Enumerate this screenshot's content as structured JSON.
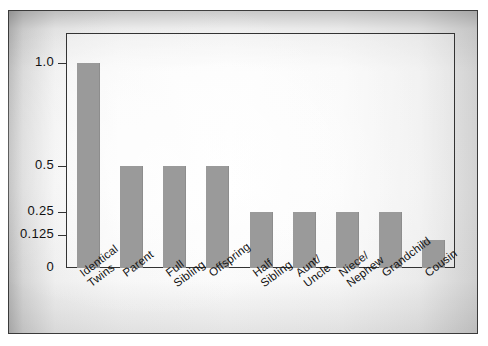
{
  "chart_data": {
    "type": "bar",
    "title": "",
    "subtitle": "",
    "xlabel": "",
    "ylabel": "",
    "grid": false,
    "legend": "none",
    "y_scale": "non-linear halving scale",
    "ylim": [
      0,
      1.0
    ],
    "y_ticks": [
      {
        "label": "1.0",
        "value": 1.0
      },
      {
        "label": "0.5",
        "value": 0.5
      },
      {
        "label": "0.25",
        "value": 0.25
      },
      {
        "label": "0.125",
        "value": 0.125
      },
      {
        "label": "0",
        "value": 0
      }
    ],
    "categories": [
      "Identical Twins",
      "Parent",
      "Full Sibling",
      "Offspring",
      "Half Sibling",
      "Aunt/ Uncle",
      "Niece/ Nephew",
      "Grandchild",
      "Cousin"
    ],
    "values": [
      1.0,
      0.5,
      0.5,
      0.5,
      0.25,
      0.25,
      0.25,
      0.25,
      0.125
    ],
    "bar_color": "#9a9a9a"
  },
  "axis": {
    "ticks": [
      {
        "label": "1.0"
      },
      {
        "label": "0.5"
      },
      {
        "label": "0.25"
      },
      {
        "label": "0.125"
      },
      {
        "label": "0"
      }
    ]
  },
  "x_labels": [
    {
      "line1": "Identical",
      "line2": "Twins"
    },
    {
      "line1": "Parent",
      "line2": ""
    },
    {
      "line1": "Full",
      "line2": "Sibling"
    },
    {
      "line1": "Offspring",
      "line2": ""
    },
    {
      "line1": "Half",
      "line2": "Sibling"
    },
    {
      "line1": "Aunt/",
      "line2": "Uncle"
    },
    {
      "line1": "Niece/",
      "line2": "Nephew"
    },
    {
      "line1": "Grandchild",
      "line2": ""
    },
    {
      "line1": "Cousin",
      "line2": ""
    }
  ]
}
